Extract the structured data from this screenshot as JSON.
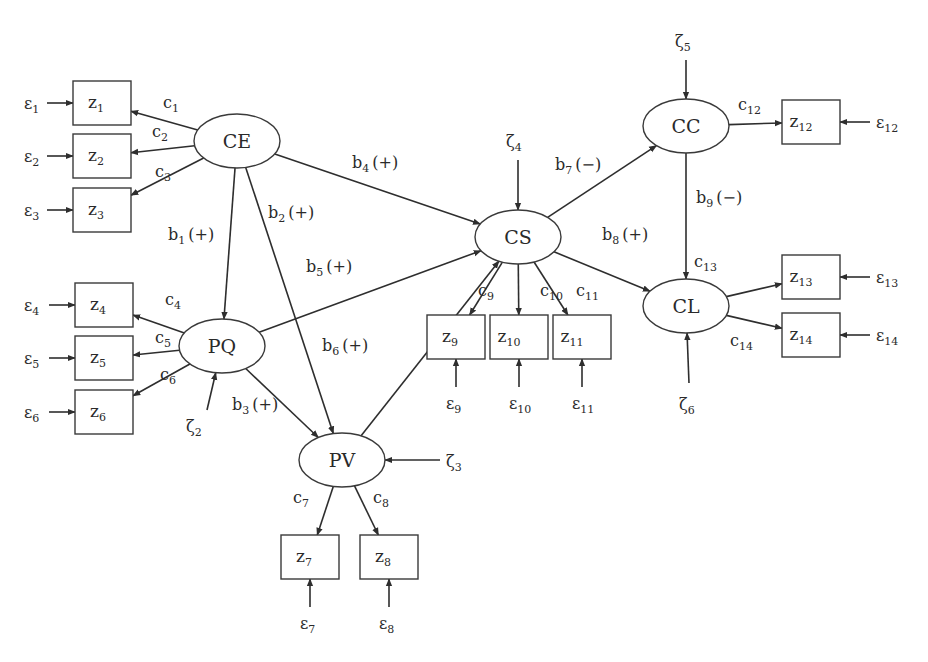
{
  "diagram": {
    "type": "structural-equation-model",
    "latent_nodes": [
      {
        "id": "CE",
        "label": "CE",
        "cx": 237,
        "cy": 141
      },
      {
        "id": "PQ",
        "label": "PQ",
        "cx": 222,
        "cy": 346
      },
      {
        "id": "PV",
        "label": "PV",
        "cx": 342,
        "cy": 460
      },
      {
        "id": "CS",
        "label": "CS",
        "cx": 518,
        "cy": 237
      },
      {
        "id": "CC",
        "label": "CC",
        "cx": 686,
        "cy": 126
      },
      {
        "id": "CL",
        "label": "CL",
        "cx": 686,
        "cy": 306
      }
    ],
    "indicators": [
      {
        "id": "z1",
        "base": "z",
        "sub": "1",
        "x": 73,
        "y": 81
      },
      {
        "id": "z2",
        "base": "z",
        "sub": "2",
        "x": 73,
        "y": 134
      },
      {
        "id": "z3",
        "base": "z",
        "sub": "3",
        "x": 73,
        "y": 188
      },
      {
        "id": "z4",
        "base": "z",
        "sub": "4",
        "x": 75,
        "y": 283
      },
      {
        "id": "z5",
        "base": "z",
        "sub": "5",
        "x": 75,
        "y": 336
      },
      {
        "id": "z6",
        "base": "z",
        "sub": "6",
        "x": 75,
        "y": 390
      },
      {
        "id": "z7",
        "base": "z",
        "sub": "7",
        "x": 281,
        "y": 535
      },
      {
        "id": "z8",
        "base": "z",
        "sub": "8",
        "x": 360,
        "y": 535
      },
      {
        "id": "z9",
        "base": "z",
        "sub": "9",
        "x": 427,
        "y": 315
      },
      {
        "id": "z10",
        "base": "z",
        "sub": "10",
        "x": 490,
        "y": 315
      },
      {
        "id": "z11",
        "base": "z",
        "sub": "11",
        "x": 553,
        "y": 315
      },
      {
        "id": "z12",
        "base": "z",
        "sub": "12",
        "x": 782,
        "y": 100
      },
      {
        "id": "z13",
        "base": "z",
        "sub": "13",
        "x": 782,
        "y": 255
      },
      {
        "id": "z14",
        "base": "z",
        "sub": "14",
        "x": 782,
        "y": 313
      }
    ],
    "structural_paths": [
      {
        "from": "CE",
        "to": "PQ",
        "base": "b",
        "sub": "1",
        "sign": "(+)"
      },
      {
        "from": "CE",
        "to": "PV",
        "base": "b",
        "sub": "2",
        "sign": "(+)"
      },
      {
        "from": "PQ",
        "to": "PV",
        "base": "b",
        "sub": "3",
        "sign": "(+)"
      },
      {
        "from": "CE",
        "to": "CS",
        "base": "b",
        "sub": "4",
        "sign": "(+)"
      },
      {
        "from": "PQ",
        "to": "CS",
        "base": "b",
        "sub": "5",
        "sign": "(+)"
      },
      {
        "from": "PV",
        "to": "CS",
        "base": "b",
        "sub": "6",
        "sign": "(+)"
      },
      {
        "from": "CS",
        "to": "CC",
        "base": "b",
        "sub": "7",
        "sign": "(−)"
      },
      {
        "from": "CS",
        "to": "CL",
        "base": "b",
        "sub": "8",
        "sign": "(+)"
      },
      {
        "from": "CC",
        "to": "CL",
        "base": "b",
        "sub": "9",
        "sign": "(−)"
      }
    ],
    "loadings": [
      {
        "from": "CE",
        "to": "z1",
        "base": "c",
        "sub": "1"
      },
      {
        "from": "CE",
        "to": "z2",
        "base": "c",
        "sub": "2"
      },
      {
        "from": "CE",
        "to": "z3",
        "base": "c",
        "sub": "3"
      },
      {
        "from": "PQ",
        "to": "z4",
        "base": "c",
        "sub": "4"
      },
      {
        "from": "PQ",
        "to": "z5",
        "base": "c",
        "sub": "5"
      },
      {
        "from": "PQ",
        "to": "z6",
        "base": "c",
        "sub": "6"
      },
      {
        "from": "PV",
        "to": "z7",
        "base": "c",
        "sub": "7"
      },
      {
        "from": "PV",
        "to": "z8",
        "base": "c",
        "sub": "8"
      },
      {
        "from": "CS",
        "to": "z9",
        "base": "c",
        "sub": "9"
      },
      {
        "from": "CS",
        "to": "z10",
        "base": "c",
        "sub": "10"
      },
      {
        "from": "CS",
        "to": "z11",
        "base": "c",
        "sub": "11"
      },
      {
        "from": "CC",
        "to": "z12",
        "base": "c",
        "sub": "12"
      },
      {
        "from": "CL",
        "to": "z13",
        "base": "c",
        "sub": "13"
      },
      {
        "from": "CL",
        "to": "z14",
        "base": "c",
        "sub": "14"
      }
    ],
    "measurement_errors": [
      {
        "to": "z1",
        "base": "ε",
        "sub": "1"
      },
      {
        "to": "z2",
        "base": "ε",
        "sub": "2"
      },
      {
        "to": "z3",
        "base": "ε",
        "sub": "3"
      },
      {
        "to": "z4",
        "base": "ε",
        "sub": "4"
      },
      {
        "to": "z5",
        "base": "ε",
        "sub": "5"
      },
      {
        "to": "z6",
        "base": "ε",
        "sub": "6"
      },
      {
        "to": "z7",
        "base": "ε",
        "sub": "7"
      },
      {
        "to": "z8",
        "base": "ε",
        "sub": "8"
      },
      {
        "to": "z9",
        "base": "ε",
        "sub": "9"
      },
      {
        "to": "z10",
        "base": "ε",
        "sub": "10"
      },
      {
        "to": "z11",
        "base": "ε",
        "sub": "11"
      },
      {
        "to": "z12",
        "base": "ε",
        "sub": "12"
      },
      {
        "to": "z13",
        "base": "ε",
        "sub": "13"
      },
      {
        "to": "z14",
        "base": "ε",
        "sub": "14"
      }
    ],
    "disturbances": [
      {
        "to": "PQ",
        "base": "ζ",
        "sub": "2"
      },
      {
        "to": "PV",
        "base": "ζ",
        "sub": "3"
      },
      {
        "to": "CS",
        "base": "ζ",
        "sub": "4"
      },
      {
        "to": "CC",
        "base": "ζ",
        "sub": "5"
      },
      {
        "to": "CL",
        "base": "ζ",
        "sub": "6"
      }
    ],
    "colors": {
      "line": "#2e2e2e",
      "text": "#2a2a2a",
      "background": "#ffffff"
    }
  }
}
